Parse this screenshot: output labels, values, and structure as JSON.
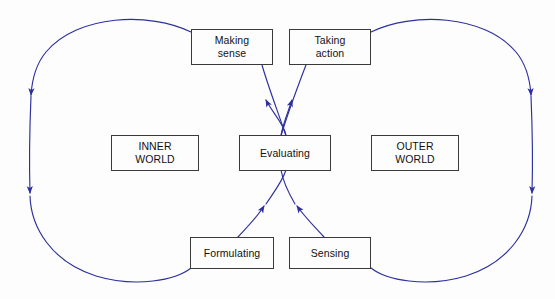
{
  "diagram": {
    "colors": {
      "arrow": "#2d2f9e",
      "box_border": "#3a3a3a",
      "background": "#fdfdfd",
      "text": "#111111"
    },
    "nodes": [
      {
        "id": "making-sense",
        "label": "Making\nsense"
      },
      {
        "id": "taking-action",
        "label": "Taking\naction"
      },
      {
        "id": "inner-world",
        "label": "INNER\nWORLD"
      },
      {
        "id": "evaluating",
        "label": "Evaluating"
      },
      {
        "id": "outer-world",
        "label": "OUTER\nWORLD"
      },
      {
        "id": "formulating",
        "label": "Formulating"
      },
      {
        "id": "sensing",
        "label": "Sensing"
      }
    ],
    "connectors": [
      {
        "id": "left-loop",
        "from": "making-sense",
        "to": "formulating",
        "arrowheads": 2,
        "direction": "clockwise-left-down"
      },
      {
        "id": "right-loop",
        "from": "taking-action",
        "to": "sensing",
        "arrowheads": 2,
        "direction": "clockwise-right-down"
      },
      {
        "id": "evaluating-to-making",
        "from": "evaluating",
        "to": "making-sense",
        "arrowheads": 1,
        "direction": "up"
      },
      {
        "id": "evaluating-to-taking",
        "from": "evaluating",
        "to": "taking-action",
        "arrowheads": 1,
        "direction": "up"
      },
      {
        "id": "formulating-to-eval",
        "from": "formulating",
        "to": "evaluating",
        "arrowheads": 1,
        "direction": "up"
      },
      {
        "id": "sensing-to-eval",
        "from": "sensing",
        "to": "evaluating",
        "arrowheads": 1,
        "direction": "up"
      }
    ]
  }
}
